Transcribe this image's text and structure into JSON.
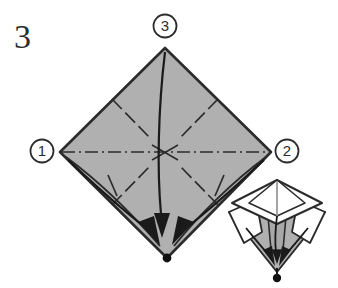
{
  "diagram": {
    "step_number": "3",
    "background_color": "#ffffff",
    "paper_fill_color": "#b0b0b0",
    "paper_stroke_color": "#2b2b2b",
    "fold_line_color": "#2b2b2b",
    "arrow_color": "#1a1a1a",
    "white_facet_color": "#ffffff"
  },
  "callouts": [
    {
      "id": "callout-1",
      "label": "1",
      "cx": 42,
      "cy": 151,
      "r": 12
    },
    {
      "id": "callout-2",
      "label": "2",
      "cx": 287,
      "cy": 151,
      "r": 12
    },
    {
      "id": "callout-3",
      "label": "3",
      "cx": 165,
      "cy": 26,
      "r": 12
    }
  ],
  "main_shape": {
    "name": "square-base-diamond",
    "vertices": {
      "top": {
        "x": 165,
        "y": 48
      },
      "left": {
        "x": 60,
        "y": 152
      },
      "right": {
        "x": 271,
        "y": 152
      },
      "bottom": {
        "x": 167,
        "y": 258
      }
    },
    "center": {
      "x": 165,
      "y": 152
    }
  },
  "fold_lines": {
    "horizontal_mountain": {
      "type": "mountain",
      "style": "dash-dot",
      "from": {
        "x": 60,
        "y": 152
      },
      "to": {
        "x": 271,
        "y": 152
      }
    },
    "diagonals": [
      {
        "type": "valley",
        "style": "dashed",
        "from": {
          "x": 112,
          "y": 99
        },
        "to": {
          "x": 150,
          "y": 138
        }
      },
      {
        "type": "valley",
        "style": "dashed",
        "from": {
          "x": 218,
          "y": 99
        },
        "to": {
          "x": 180,
          "y": 138
        }
      },
      {
        "type": "valley",
        "style": "dashed",
        "from": {
          "x": 112,
          "y": 205
        },
        "to": {
          "x": 150,
          "y": 166
        }
      },
      {
        "type": "valley",
        "style": "dashed",
        "from": {
          "x": 218,
          "y": 205
        },
        "to": {
          "x": 180,
          "y": 166
        }
      }
    ]
  },
  "arrows": [
    {
      "id": "arrow-top-to-bottom",
      "description": "fold top point down to bottom point",
      "from_callout": "3",
      "path": "M 165 52 C 158 110, 157 170, 161 216",
      "head_at": {
        "x": 162,
        "y": 234
      },
      "head_angle": 94
    },
    {
      "id": "arrow-left-to-bottom",
      "description": "fold left point down to bottom point",
      "from_callout": "1",
      "path": "M 66 158 C 96 186, 130 212, 152 230",
      "head_at": {
        "x": 161,
        "y": 245
      },
      "head_angle": 53
    },
    {
      "id": "arrow-right-to-bottom",
      "description": "fold right point down to bottom point",
      "from_callout": "2",
      "path": "M 266 158 C 236 186, 200 212, 178 230",
      "head_at": {
        "x": 172,
        "y": 245
      },
      "head_angle": 127
    }
  ],
  "base_point": {
    "name": "bottom-apex-dot",
    "x": 167,
    "y": 258,
    "r": 4.2
  },
  "inset_figure": {
    "name": "three-dimensional-preview",
    "description": "small perspective view of the same model with flaps folding to the base point",
    "bounds": {
      "x": 228,
      "y": 176,
      "width": 98,
      "height": 110
    },
    "base_dot": {
      "x": 277,
      "y": 278,
      "r": 4
    }
  }
}
